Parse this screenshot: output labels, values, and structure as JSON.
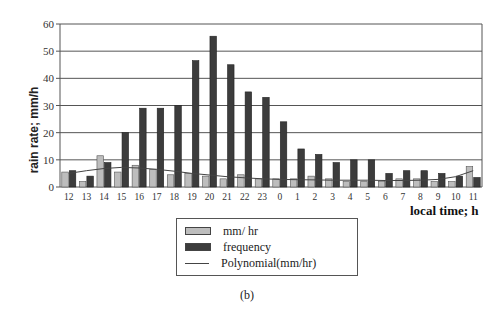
{
  "chart_data": {
    "type": "bar",
    "title": "",
    "xlabel": "local time; h",
    "ylabel": "rain rate; mm/h",
    "ylim": [
      0,
      60
    ],
    "yticks": [
      0,
      10,
      20,
      30,
      40,
      50,
      60
    ],
    "grid": true,
    "legend_position": "bottom-center",
    "categories": [
      "12",
      "13",
      "14",
      "15",
      "16",
      "17",
      "18",
      "19",
      "20",
      "21",
      "22",
      "23",
      "0",
      "1",
      "2",
      "3",
      "4",
      "5",
      "6",
      "7",
      "8",
      "9",
      "10",
      "11"
    ],
    "series": [
      {
        "name": "mm/ hr",
        "type": "bar",
        "color": "#bdbdbd",
        "values": [
          5.5,
          2,
          11.5,
          5.5,
          8,
          6.5,
          4.5,
          5,
          4,
          3,
          4.5,
          3,
          3,
          3,
          4,
          3,
          2,
          2,
          2,
          3,
          3,
          2,
          2,
          7.5
        ]
      },
      {
        "name": "frequency",
        "type": "bar",
        "color": "#3c3c3c",
        "values": [
          6,
          4,
          9,
          20,
          29,
          29,
          30,
          46.5,
          55.5,
          45,
          35,
          33,
          24,
          14,
          12,
          9,
          10,
          10,
          5,
          6,
          6,
          5,
          4,
          3.5
        ]
      },
      {
        "name": "Polynomial(mm/hr)",
        "type": "line",
        "color": "#444444",
        "values": [
          5,
          6,
          6.8,
          7.2,
          7,
          6.5,
          5.8,
          5,
          4.4,
          3.8,
          3.4,
          3,
          2.8,
          2.7,
          2.6,
          2.5,
          2.5,
          2.5,
          2.4,
          2.4,
          2.5,
          2.8,
          3.8,
          6
        ]
      }
    ]
  },
  "legend": {
    "items": [
      {
        "label": "mm/  hr",
        "swatch": "light"
      },
      {
        "label": "frequency",
        "swatch": "dark"
      },
      {
        "label": "Polynomial(mm/hr)",
        "swatch": "line"
      }
    ]
  },
  "caption": "(b)"
}
